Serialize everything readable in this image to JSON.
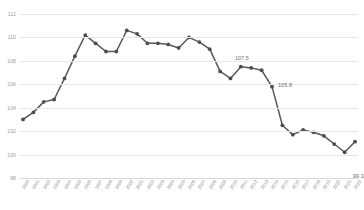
{
  "chart_data": {
    "type": "line",
    "title": "",
    "xlabel": "",
    "ylabel": "",
    "ylim": [
      98,
      112
    ],
    "yticks": [
      98,
      100,
      102,
      104,
      106,
      108,
      110,
      112
    ],
    "grid": true,
    "legend": "none",
    "line_color": "#595959",
    "marker_color": "#4d4d4d",
    "gridline_color": "#e8e8e8",
    "categories": [
      "1990",
      "1991",
      "1992",
      "1993",
      "1994",
      "1995",
      "1996",
      "1997",
      "1998",
      "1999",
      "2000",
      "2001",
      "2002",
      "2003",
      "2004",
      "2005",
      "2006",
      "2007",
      "2008",
      "2009",
      "2010",
      "2011",
      "2012",
      "2013",
      "2014",
      "2015",
      "2016",
      "2017",
      "2018",
      "2019",
      "2020",
      "2021",
      "2022"
    ],
    "values": [
      103.0,
      103.6,
      104.5,
      104.7,
      106.5,
      108.4,
      110.2,
      109.5,
      108.8,
      108.8,
      110.6,
      110.3,
      109.5,
      109.5,
      109.4,
      109.1,
      110.0,
      109.6,
      109.0,
      107.1,
      106.5,
      107.5,
      107.4,
      107.2,
      105.8,
      102.5,
      101.7,
      102.1,
      101.9,
      101.6,
      100.9,
      100.2,
      101.1
    ],
    "last_value": 99.3,
    "annotations": [
      {
        "label": "107.5",
        "value": 107.5,
        "category": "2011"
      },
      {
        "label": "105.8",
        "value": 105.8,
        "category": "2014"
      },
      {
        "label": "99.3",
        "value": 99.3,
        "category": "2022"
      }
    ]
  }
}
